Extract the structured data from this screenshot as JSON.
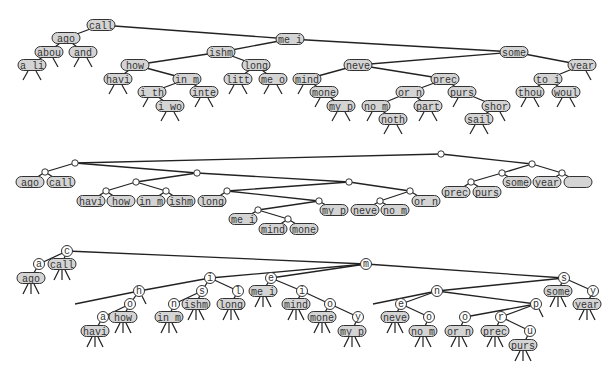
{
  "colors": {
    "node_fill": "#d4d4d4",
    "node_stroke": "#333333",
    "edge": "#222222",
    "background": "#ffffff",
    "circle_fill": "#ffffff"
  },
  "diagrams": [
    {
      "name": "binary-search-tree",
      "nodes": [
        {
          "id": "call",
          "label": "call",
          "x": 101,
          "y": 25
        },
        {
          "id": "ago",
          "label": "ago",
          "x": 66,
          "y": 38
        },
        {
          "id": "abou",
          "label": "abou",
          "x": 49,
          "y": 52
        },
        {
          "id": "and",
          "label": "and",
          "x": 83,
          "y": 52
        },
        {
          "id": "ali",
          "label": "a li",
          "x": 32,
          "y": 65
        },
        {
          "id": "mei",
          "label": "me i",
          "x": 290,
          "y": 39
        },
        {
          "id": "ishm",
          "label": "ishm",
          "x": 221,
          "y": 52
        },
        {
          "id": "how",
          "label": "how",
          "x": 135,
          "y": 65
        },
        {
          "id": "havi",
          "label": "havi",
          "x": 118,
          "y": 79
        },
        {
          "id": "inm",
          "label": "in m",
          "x": 187,
          "y": 79
        },
        {
          "id": "ith",
          "label": "i th",
          "x": 152,
          "y": 92
        },
        {
          "id": "iwo",
          "label": "i wo",
          "x": 170,
          "y": 106
        },
        {
          "id": "inte",
          "label": "inte",
          "x": 204,
          "y": 92
        },
        {
          "id": "long",
          "label": "long",
          "x": 256,
          "y": 65
        },
        {
          "id": "litt",
          "label": "litt",
          "x": 238,
          "y": 79
        },
        {
          "id": "meo",
          "label": "me o",
          "x": 273,
          "y": 79
        },
        {
          "id": "some",
          "label": "some",
          "x": 514,
          "y": 52
        },
        {
          "id": "neve",
          "label": "neve",
          "x": 358,
          "y": 65
        },
        {
          "id": "mind",
          "label": "mind",
          "x": 307,
          "y": 79
        },
        {
          "id": "mone",
          "label": "mone",
          "x": 324,
          "y": 92
        },
        {
          "id": "myp",
          "label": "my p",
          "x": 341,
          "y": 106
        },
        {
          "id": "prec",
          "label": "prec",
          "x": 445,
          "y": 79
        },
        {
          "id": "orn",
          "label": "or n",
          "x": 410,
          "y": 92
        },
        {
          "id": "nom",
          "label": "no m",
          "x": 376,
          "y": 106
        },
        {
          "id": "noth",
          "label": "noth",
          "x": 393,
          "y": 119
        },
        {
          "id": "part",
          "label": "part",
          "x": 428,
          "y": 106
        },
        {
          "id": "purs",
          "label": "purs",
          "x": 462,
          "y": 92
        },
        {
          "id": "shor",
          "label": "shor",
          "x": 496,
          "y": 106
        },
        {
          "id": "sail",
          "label": "sail",
          "x": 479,
          "y": 119
        },
        {
          "id": "year",
          "label": "year",
          "x": 582,
          "y": 65
        },
        {
          "id": "toi",
          "label": "to i",
          "x": 548,
          "y": 79
        },
        {
          "id": "thou",
          "label": "thou",
          "x": 530,
          "y": 92
        },
        {
          "id": "woul",
          "label": "woul",
          "x": 566,
          "y": 92
        }
      ],
      "edges": [
        [
          "call",
          "ago"
        ],
        [
          "ago",
          "abou"
        ],
        [
          "ago",
          "and"
        ],
        [
          "abou",
          "ali"
        ],
        [
          "call",
          "mei"
        ],
        [
          "mei",
          "ishm"
        ],
        [
          "ishm",
          "how"
        ],
        [
          "how",
          "havi"
        ],
        [
          "how",
          "inm"
        ],
        [
          "inm",
          "ith"
        ],
        [
          "ith",
          "iwo"
        ],
        [
          "inm",
          "inte"
        ],
        [
          "ishm",
          "long"
        ],
        [
          "long",
          "litt"
        ],
        [
          "long",
          "meo"
        ],
        [
          "mei",
          "some"
        ],
        [
          "some",
          "neve"
        ],
        [
          "neve",
          "mind"
        ],
        [
          "mind",
          "mone"
        ],
        [
          "mone",
          "myp"
        ],
        [
          "neve",
          "prec"
        ],
        [
          "prec",
          "orn"
        ],
        [
          "orn",
          "nom"
        ],
        [
          "nom",
          "noth"
        ],
        [
          "orn",
          "part"
        ],
        [
          "prec",
          "purs"
        ],
        [
          "purs",
          "shor"
        ],
        [
          "shor",
          "sail"
        ],
        [
          "some",
          "year"
        ],
        [
          "year",
          "toi"
        ],
        [
          "toi",
          "thou"
        ],
        [
          "toi",
          "woul"
        ]
      ]
    },
    {
      "name": "b-tree-with-junctions",
      "junctions": [
        {
          "id": "j_root",
          "x": 441,
          "y": 154
        },
        {
          "id": "j_left",
          "x": 75,
          "y": 163
        },
        {
          "id": "j_agocall",
          "x": 45,
          "y": 172
        },
        {
          "id": "j_mid",
          "x": 197,
          "y": 173
        },
        {
          "id": "j_how",
          "x": 136,
          "y": 182
        },
        {
          "id": "j_havi",
          "x": 106,
          "y": 191
        },
        {
          "id": "j_ishm",
          "x": 166,
          "y": 191
        },
        {
          "id": "j_mid2",
          "x": 349,
          "y": 182
        },
        {
          "id": "j_long",
          "x": 227,
          "y": 191
        },
        {
          "id": "j_myp",
          "x": 319,
          "y": 201
        },
        {
          "id": "j_mei",
          "x": 258,
          "y": 210
        },
        {
          "id": "j_mind",
          "x": 288,
          "y": 219
        },
        {
          "id": "j_orn",
          "x": 410,
          "y": 191
        },
        {
          "id": "j_neve",
          "x": 380,
          "y": 201
        },
        {
          "id": "j_right",
          "x": 532,
          "y": 164
        },
        {
          "id": "j_prec",
          "x": 502,
          "y": 173
        },
        {
          "id": "j_purs",
          "x": 471,
          "y": 182
        },
        {
          "id": "j_year",
          "x": 562,
          "y": 173
        }
      ],
      "leaves": [
        {
          "id": "l_ago",
          "label": "ago",
          "x": 30,
          "y": 182
        },
        {
          "id": "l_call",
          "label": "call",
          "x": 61,
          "y": 182
        },
        {
          "id": "l_havi",
          "label": "havi",
          "x": 91,
          "y": 201
        },
        {
          "id": "l_how",
          "label": "how",
          "x": 121,
          "y": 201
        },
        {
          "id": "l_inm",
          "label": "in m",
          "x": 151,
          "y": 201
        },
        {
          "id": "l_ishm",
          "label": "ishm",
          "x": 181,
          "y": 201
        },
        {
          "id": "l_long",
          "label": "long",
          "x": 212,
          "y": 201
        },
        {
          "id": "l_mei",
          "label": "me i",
          "x": 243,
          "y": 219
        },
        {
          "id": "l_mind",
          "label": "mind",
          "x": 273,
          "y": 229
        },
        {
          "id": "l_mone",
          "label": "mone",
          "x": 304,
          "y": 229
        },
        {
          "id": "l_myp",
          "label": "my p",
          "x": 334,
          "y": 210
        },
        {
          "id": "l_neve",
          "label": "neve",
          "x": 365,
          "y": 210
        },
        {
          "id": "l_nom",
          "label": "no m",
          "x": 395,
          "y": 210
        },
        {
          "id": "l_orn",
          "label": "or n",
          "x": 426,
          "y": 201
        },
        {
          "id": "l_prec",
          "label": "prec",
          "x": 456,
          "y": 192
        },
        {
          "id": "l_purs",
          "label": "purs",
          "x": 487,
          "y": 192
        },
        {
          "id": "l_some",
          "label": "some",
          "x": 517,
          "y": 182
        },
        {
          "id": "l_year",
          "label": "year",
          "x": 547,
          "y": 182
        },
        {
          "id": "l_empty",
          "label": "",
          "x": 578,
          "y": 182
        }
      ],
      "edges": [
        [
          "j_root",
          "j_left"
        ],
        [
          "j_left",
          "j_agocall"
        ],
        [
          "j_agocall",
          "l_ago"
        ],
        [
          "j_agocall",
          "l_call"
        ],
        [
          "j_left",
          "j_mid"
        ],
        [
          "j_mid",
          "j_how"
        ],
        [
          "j_how",
          "j_havi"
        ],
        [
          "j_havi",
          "l_havi"
        ],
        [
          "j_havi",
          "l_how"
        ],
        [
          "j_how",
          "j_ishm"
        ],
        [
          "j_ishm",
          "l_inm"
        ],
        [
          "j_ishm",
          "l_ishm"
        ],
        [
          "j_mid",
          "j_mid2"
        ],
        [
          "j_mid2",
          "j_long"
        ],
        [
          "j_long",
          "l_long"
        ],
        [
          "j_long",
          "j_myp"
        ],
        [
          "j_myp",
          "j_mei"
        ],
        [
          "j_mei",
          "l_mei"
        ],
        [
          "j_mei",
          "j_mind"
        ],
        [
          "j_mind",
          "l_mind"
        ],
        [
          "j_mind",
          "l_mone"
        ],
        [
          "j_myp",
          "l_myp"
        ],
        [
          "j_mid2",
          "j_orn"
        ],
        [
          "j_orn",
          "j_neve"
        ],
        [
          "j_neve",
          "l_neve"
        ],
        [
          "j_neve",
          "l_nom"
        ],
        [
          "j_orn",
          "l_orn"
        ],
        [
          "j_root",
          "j_right"
        ],
        [
          "j_right",
          "j_prec"
        ],
        [
          "j_prec",
          "j_purs"
        ],
        [
          "j_purs",
          "l_prec"
        ],
        [
          "j_purs",
          "l_purs"
        ],
        [
          "j_prec",
          "l_some"
        ],
        [
          "j_right",
          "j_year"
        ],
        [
          "j_year",
          "l_year"
        ],
        [
          "j_year",
          "l_empty"
        ]
      ]
    },
    {
      "name": "trie",
      "letters": [
        {
          "id": "t_c",
          "label": "c",
          "x": 67,
          "y": 251
        },
        {
          "id": "t_a",
          "label": "a",
          "x": 39,
          "y": 264
        },
        {
          "id": "t_m",
          "label": "m",
          "x": 366,
          "y": 264
        },
        {
          "id": "t_i",
          "label": "i",
          "x": 210,
          "y": 278
        },
        {
          "id": "t_h",
          "label": "h",
          "x": 139,
          "y": 291
        },
        {
          "id": "t_o1",
          "label": "o",
          "x": 130,
          "y": 304
        },
        {
          "id": "t_a2",
          "label": "a",
          "x": 103,
          "y": 317
        },
        {
          "id": "t_s1",
          "label": "s",
          "x": 202,
          "y": 291
        },
        {
          "id": "t_n1",
          "label": "n",
          "x": 174,
          "y": 304
        },
        {
          "id": "t_l",
          "label": "l",
          "x": 238,
          "y": 291
        },
        {
          "id": "t_e1",
          "label": "e",
          "x": 271,
          "y": 278
        },
        {
          "id": "t_i2",
          "label": "i",
          "x": 302,
          "y": 291
        },
        {
          "id": "t_o2",
          "label": "o",
          "x": 330,
          "y": 304
        },
        {
          "id": "t_y1",
          "label": "y",
          "x": 358,
          "y": 317
        },
        {
          "id": "t_s2",
          "label": "s",
          "x": 564,
          "y": 278
        },
        {
          "id": "t_y2",
          "label": "y",
          "x": 593,
          "y": 291
        },
        {
          "id": "t_n2",
          "label": "n",
          "x": 437,
          "y": 291
        },
        {
          "id": "t_e2",
          "label": "e",
          "x": 401,
          "y": 304
        },
        {
          "id": "t_o3",
          "label": "o",
          "x": 429,
          "y": 317
        },
        {
          "id": "t_p",
          "label": "p",
          "x": 536,
          "y": 304
        },
        {
          "id": "t_o4",
          "label": "o",
          "x": 465,
          "y": 317
        },
        {
          "id": "t_r",
          "label": "r",
          "x": 501,
          "y": 317
        },
        {
          "id": "t_u",
          "label": "u",
          "x": 530,
          "y": 331
        }
      ],
      "words": [
        {
          "id": "w_ago",
          "label": "ago",
          "x": 31,
          "y": 278
        },
        {
          "id": "w_call",
          "label": "call",
          "x": 62,
          "y": 264
        },
        {
          "id": "w_havi",
          "label": "havi",
          "x": 95,
          "y": 331
        },
        {
          "id": "w_how",
          "label": "how",
          "x": 123,
          "y": 317
        },
        {
          "id": "w_inm",
          "label": "in m",
          "x": 169,
          "y": 317
        },
        {
          "id": "w_ishm",
          "label": "ishm",
          "x": 196,
          "y": 304
        },
        {
          "id": "w_long",
          "label": "long",
          "x": 231,
          "y": 304
        },
        {
          "id": "w_mei",
          "label": "me i",
          "x": 263,
          "y": 291
        },
        {
          "id": "w_mind",
          "label": "mind",
          "x": 296,
          "y": 304
        },
        {
          "id": "w_mone",
          "label": "mone",
          "x": 322,
          "y": 317
        },
        {
          "id": "w_myp",
          "label": "my p",
          "x": 352,
          "y": 331
        },
        {
          "id": "w_neve",
          "label": "neve",
          "x": 395,
          "y": 317
        },
        {
          "id": "w_nom",
          "label": "no m",
          "x": 423,
          "y": 331
        },
        {
          "id": "w_orn",
          "label": "or n",
          "x": 459,
          "y": 331
        },
        {
          "id": "w_prec",
          "label": "prec",
          "x": 495,
          "y": 331
        },
        {
          "id": "w_purs",
          "label": "purs",
          "x": 523,
          "y": 345
        },
        {
          "id": "w_some",
          "label": "some",
          "x": 558,
          "y": 291
        },
        {
          "id": "w_year",
          "label": "year",
          "x": 587,
          "y": 304
        }
      ],
      "edges": [
        [
          "t_c",
          "t_a"
        ],
        [
          "t_a",
          "w_ago"
        ],
        [
          "t_c",
          "w_call"
        ],
        [
          "t_c",
          "t_m"
        ],
        [
          "t_m",
          "t_i"
        ],
        [
          "t_i",
          "t_h"
        ],
        [
          "t_h",
          "t_o1"
        ],
        [
          "t_o1",
          "t_a2"
        ],
        [
          "t_a2",
          "w_havi"
        ],
        [
          "t_o1",
          "w_how"
        ],
        [
          "t_i",
          "t_s1"
        ],
        [
          "t_s1",
          "t_n1"
        ],
        [
          "t_n1",
          "w_inm"
        ],
        [
          "t_s1",
          "w_ishm"
        ],
        [
          "t_i",
          "t_l"
        ],
        [
          "t_l",
          "w_long"
        ],
        [
          "t_m",
          "t_e1"
        ],
        [
          "t_e1",
          "w_mei"
        ],
        [
          "t_e1",
          "t_i2"
        ],
        [
          "t_i2",
          "w_mind"
        ],
        [
          "t_i2",
          "t_o2"
        ],
        [
          "t_o2",
          "w_mone"
        ],
        [
          "t_o2",
          "t_y1"
        ],
        [
          "t_y1",
          "w_myp"
        ],
        [
          "t_m",
          "t_s2"
        ],
        [
          "t_s2",
          "w_some"
        ],
        [
          "t_s2",
          "t_y2"
        ],
        [
          "t_y2",
          "w_year"
        ],
        [
          "t_s2",
          "t_n2"
        ],
        [
          "t_n2",
          "t_e2"
        ],
        [
          "t_e2",
          "w_neve"
        ],
        [
          "t_e2",
          "t_o3"
        ],
        [
          "t_o3",
          "w_nom"
        ],
        [
          "t_n2",
          "t_p"
        ],
        [
          "t_p",
          "t_o4"
        ],
        [
          "t_o4",
          "w_orn"
        ],
        [
          "t_p",
          "t_r"
        ],
        [
          "t_r",
          "w_prec"
        ],
        [
          "t_r",
          "t_u"
        ],
        [
          "t_u",
          "w_purs"
        ]
      ],
      "long_left_edge": {
        "from": "t_h",
        "x2": 75,
        "y2": 304
      },
      "extra_left_edges": [
        {
          "from": "t_n2",
          "x2": 373,
          "y2": 304
        }
      ],
      "upper_junction_lines": [
        [
          "t_m",
          "t_e1"
        ],
        [
          "t_m",
          "t_i"
        ]
      ]
    }
  ]
}
